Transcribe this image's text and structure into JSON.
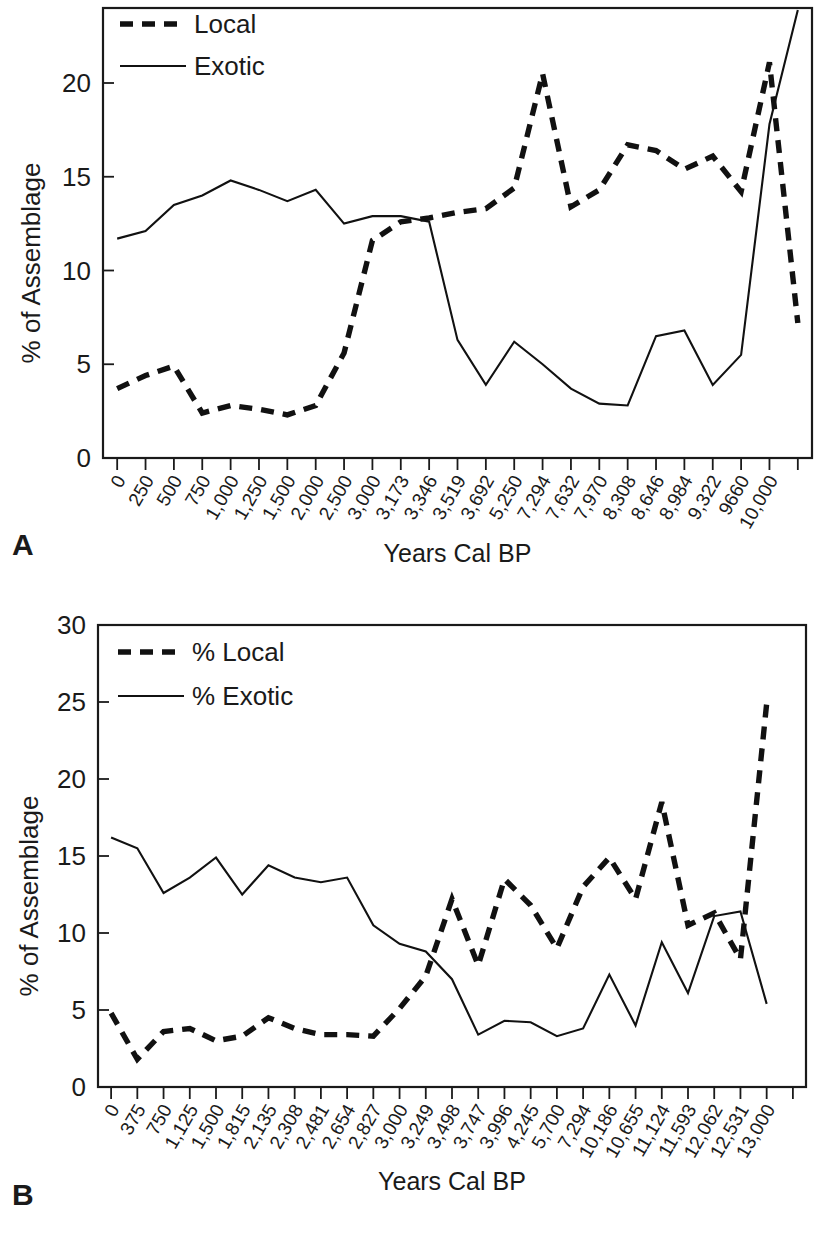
{
  "figure": {
    "panel_a_letter": "A",
    "panel_b_letter": "B"
  },
  "chart_data": [
    {
      "id": "panel_a",
      "type": "line",
      "title": "",
      "xlabel": "Years Cal BP",
      "ylabel": "% of Assemblage",
      "ylim": [
        0,
        24
      ],
      "yticks": [
        0,
        5,
        10,
        15,
        20
      ],
      "grid": false,
      "legend_position": "top-left",
      "categories": [
        "0",
        "250",
        "500",
        "750",
        "1,000",
        "1,250",
        "1,500",
        "2,000",
        "2,500",
        "3,000",
        "3,173",
        "3,346",
        "3,519",
        "3,692",
        "5,250",
        "7,294",
        "7,632",
        "7,970",
        "8,308",
        "8,646",
        "8,984",
        "9,322",
        "9660",
        "10,000"
      ],
      "series": [
        {
          "name": "Local",
          "style": "dashed",
          "values": [
            3.7,
            4.4,
            4.9,
            2.4,
            2.8,
            2.6,
            2.3,
            2.8,
            5.6,
            11.6,
            12.6,
            12.8,
            13.1,
            13.3,
            14.4,
            20.5,
            13.4,
            14.3,
            16.7,
            16.4,
            15.4,
            16.1,
            14.2,
            21.1,
            7.2
          ]
        },
        {
          "name": "Exotic",
          "style": "solid",
          "values": [
            11.7,
            12.1,
            13.5,
            14.0,
            14.8,
            14.3,
            13.7,
            14.3,
            12.5,
            12.9,
            12.9,
            12.6,
            6.3,
            3.9,
            6.2,
            5.0,
            3.7,
            2.9,
            2.8,
            6.5,
            6.8,
            3.9,
            5.5,
            17.8,
            23.9
          ]
        }
      ]
    },
    {
      "id": "panel_b",
      "type": "line",
      "title": "",
      "xlabel": "Years Cal BP",
      "ylabel": "% of Assemblage",
      "ylim": [
        0,
        30
      ],
      "yticks": [
        0,
        5,
        10,
        15,
        20,
        25,
        30
      ],
      "grid": false,
      "legend_position": "top-left",
      "categories": [
        "0",
        "375",
        "750",
        "1,125",
        "1,500",
        "1,815",
        "2,135",
        "2,308",
        "2,481",
        "2,654",
        "2,827",
        "3,000",
        "3,249",
        "3,498",
        "3,747",
        "3,996",
        "4,245",
        "5,700",
        "7,294",
        "10,186",
        "10,655",
        "11,124",
        "11,593",
        "12,062",
        "12,531",
        "13,000"
      ],
      "series": [
        {
          "name": "% Local",
          "style": "dashed",
          "values": [
            4.8,
            1.8,
            3.6,
            3.8,
            3.0,
            3.3,
            4.5,
            3.8,
            3.4,
            3.4,
            3.3,
            5.1,
            7.2,
            12.2,
            7.9,
            13.5,
            11.8,
            9.0,
            13.0,
            14.9,
            12.2,
            18.5,
            10.5,
            11.3,
            8.3,
            24.9
          ]
        },
        {
          "name": "% Exotic",
          "style": "solid",
          "values": [
            16.2,
            15.5,
            12.6,
            13.6,
            14.9,
            12.5,
            14.4,
            13.6,
            13.3,
            13.6,
            10.5,
            9.3,
            8.8,
            7.0,
            3.4,
            4.3,
            4.2,
            3.3,
            3.8,
            7.3,
            4.0,
            9.4,
            6.1,
            11.1,
            11.4,
            5.4
          ]
        }
      ]
    }
  ]
}
